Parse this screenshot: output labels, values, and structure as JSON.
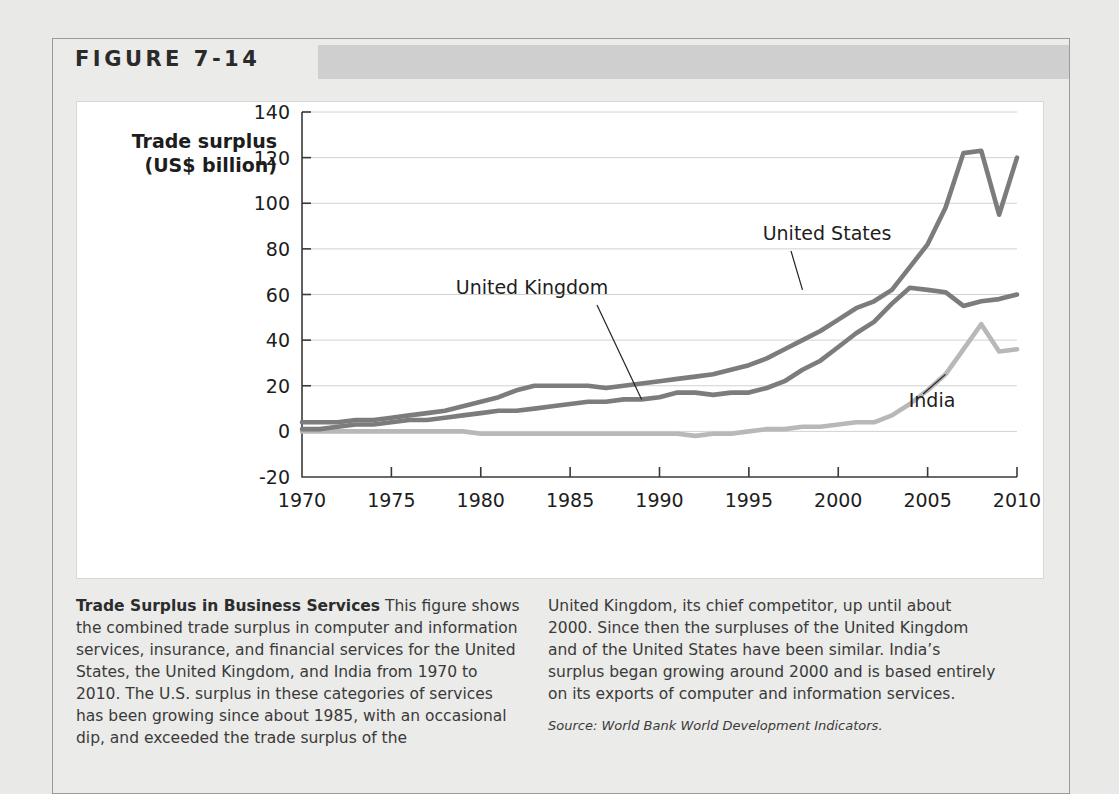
{
  "figure": {
    "number_label": "FIGURE 7-14"
  },
  "chart_data": {
    "type": "line",
    "title": "",
    "xlabel": "",
    "ylabel": "Trade surplus\n(US$ billion)",
    "ylabel_line1": "Trade surplus",
    "ylabel_line2": "(US$ billion)",
    "xlim": [
      1970,
      2010
    ],
    "ylim": [
      -20,
      140
    ],
    "ytick_labels": [
      "140",
      "120",
      "100",
      "80",
      "60",
      "40",
      "20",
      "0",
      "-20"
    ],
    "ytick_values": [
      140,
      120,
      100,
      80,
      60,
      40,
      20,
      0,
      -20
    ],
    "xtick_labels": [
      "1970",
      "1975",
      "1980",
      "1985",
      "1990",
      "1995",
      "2000",
      "2005",
      "2010"
    ],
    "xtick_values": [
      1970,
      1975,
      1980,
      1985,
      1990,
      1995,
      2000,
      2005,
      2010
    ],
    "grid": "horizontal",
    "legend_position": "inline-annotations",
    "x": [
      1970,
      1971,
      1972,
      1973,
      1974,
      1975,
      1976,
      1977,
      1978,
      1979,
      1980,
      1981,
      1982,
      1983,
      1984,
      1985,
      1986,
      1987,
      1988,
      1989,
      1990,
      1991,
      1992,
      1993,
      1994,
      1995,
      1996,
      1997,
      1998,
      1999,
      2000,
      2001,
      2002,
      2003,
      2004,
      2005,
      2006,
      2007,
      2008,
      2009,
      2010
    ],
    "series": [
      {
        "name": "United Kingdom",
        "color": "#7c7c7c",
        "values": [
          4,
          4,
          4,
          5,
          5,
          6,
          7,
          8,
          9,
          11,
          13,
          15,
          18,
          20,
          20,
          20,
          20,
          19,
          20,
          21,
          22,
          23,
          24,
          25,
          27,
          29,
          32,
          36,
          40,
          44,
          49,
          54,
          57,
          62,
          72,
          82,
          98,
          122,
          123,
          95,
          120
        ]
      },
      {
        "name": "United States",
        "color": "#7c7c7c",
        "values": [
          1,
          1,
          2,
          3,
          3,
          4,
          5,
          5,
          6,
          7,
          8,
          9,
          9,
          10,
          11,
          12,
          13,
          13,
          14,
          14,
          15,
          17,
          17,
          16,
          17,
          17,
          19,
          22,
          27,
          31,
          37,
          43,
          48,
          56,
          63,
          62,
          61,
          55,
          57,
          58,
          60
        ]
      },
      {
        "name": "India",
        "color": "#b8b8b8",
        "values": [
          0,
          0,
          0,
          0,
          0,
          0,
          0,
          0,
          0,
          0,
          -1,
          -1,
          -1,
          -1,
          -1,
          -1,
          -1,
          -1,
          -1,
          -1,
          -1,
          -1,
          -2,
          -1,
          -1,
          0,
          1,
          1,
          2,
          2,
          3,
          4,
          4,
          7,
          12,
          18,
          25,
          36,
          47,
          35,
          36
        ]
      }
    ],
    "annotations": [
      {
        "label": "United Kingdom",
        "points_to_year": 1989,
        "points_to_value": 14
      },
      {
        "label": "United States",
        "points_to_year": 1998,
        "points_to_value": 62
      },
      {
        "label": "India",
        "points_to_year": 2006,
        "points_to_value": 25
      }
    ]
  },
  "caption": {
    "title": "Trade Surplus in Business Services",
    "body_left": " This figure shows the combined trade surplus in computer and information services, insurance, and financial services for the United States, the United Kingdom, and India from 1970 to 2010. The U.S. surplus in these categories of services has been growing since about 1985, with an occasional dip, and exceeded the trade surplus of the",
    "body_right": "United Kingdom, its chief competitor, up until about 2000. Since then the surpluses of the United Kingdom and of the United States have been similar. India’s surplus began growing around 2000 and is based entirely on its exports of computer and information services.",
    "source": "Source: World Bank World Development Indicators."
  }
}
